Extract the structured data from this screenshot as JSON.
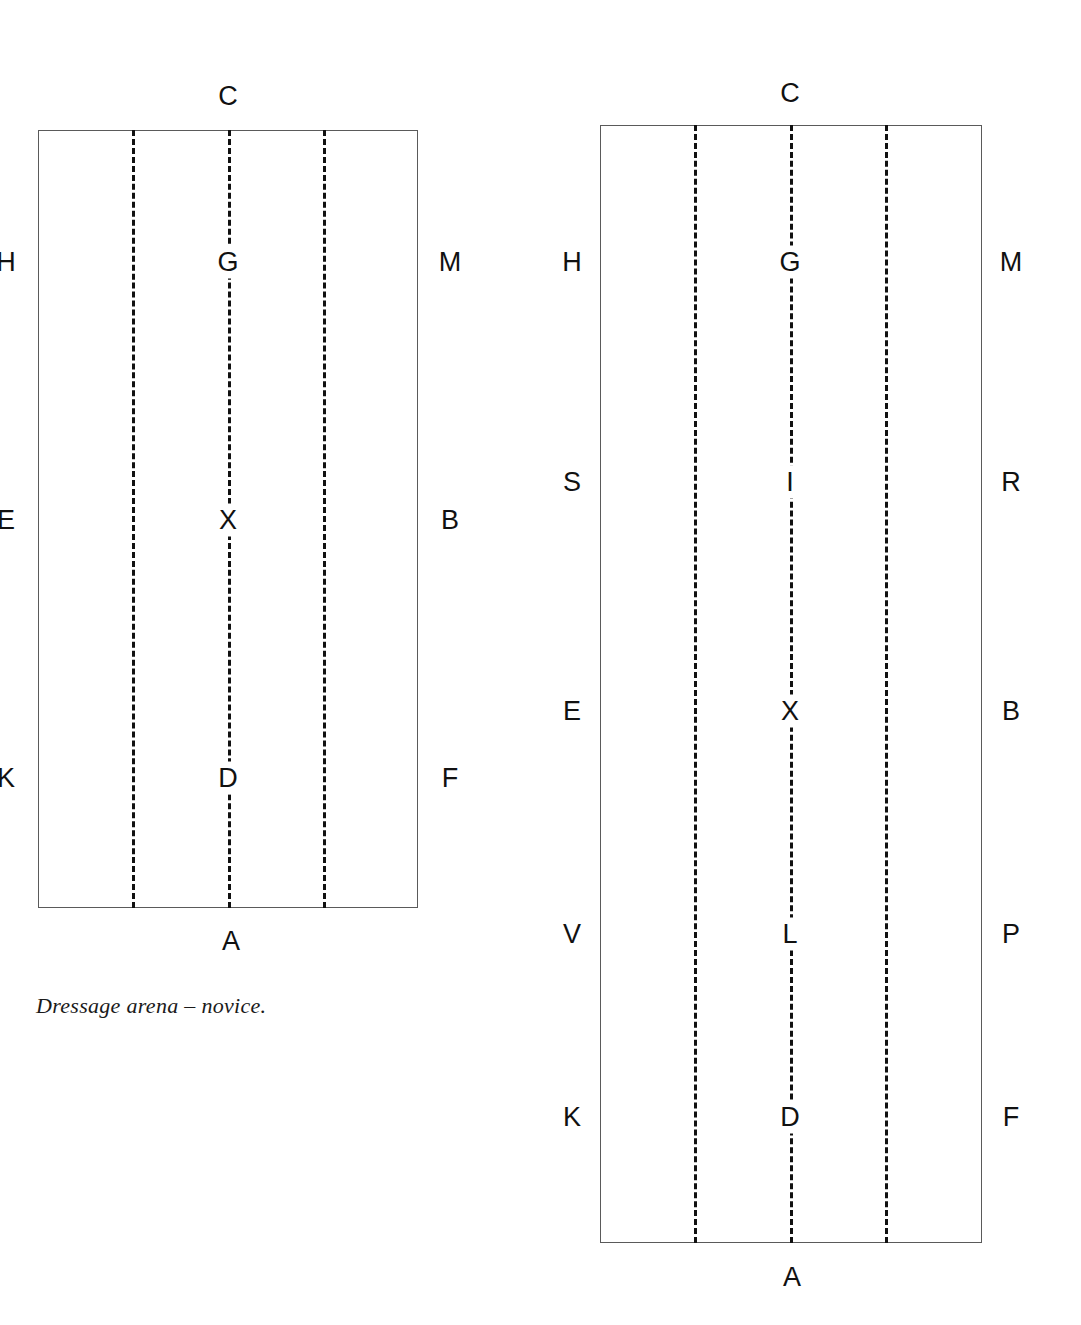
{
  "page": {
    "background_color": "#ffffff",
    "width": 1081,
    "height": 1325
  },
  "figures": [
    {
      "id": "novice-arena",
      "name": "Dressage arena - novice (20m x 40m)",
      "caption": "Dressage arena – novice.",
      "top_label": "C",
      "bottom_label": "A",
      "left_letters": [
        "H",
        "E",
        "K"
      ],
      "right_letters": [
        "M",
        "B",
        "F"
      ],
      "centre_letters": [
        "G",
        "X",
        "D"
      ]
    },
    {
      "id": "standard-arena",
      "name": "Dressage arena - standard (20m x 60m)",
      "caption": "",
      "top_label": "C",
      "bottom_label": "A",
      "left_letters": [
        "H",
        "S",
        "E",
        "V",
        "K"
      ],
      "right_letters": [
        "M",
        "R",
        "B",
        "P",
        "F"
      ],
      "centre_letters": [
        "G",
        "I",
        "X",
        "L",
        "D"
      ]
    }
  ],
  "left_arena": {
    "top_label": "C",
    "bottom_label": "A",
    "left_markers": [
      {
        "label": "H"
      },
      {
        "label": "E"
      },
      {
        "label": "K"
      }
    ],
    "right_markers": [
      {
        "label": "M"
      },
      {
        "label": "B"
      },
      {
        "label": "F"
      }
    ],
    "centre_markers": [
      {
        "label": "G"
      },
      {
        "label": "X"
      },
      {
        "label": "D"
      }
    ],
    "caption": "Dressage arena – novice."
  },
  "right_arena": {
    "top_label": "C",
    "bottom_label": "A",
    "left_markers": [
      {
        "label": "H"
      },
      {
        "label": "S"
      },
      {
        "label": "E"
      },
      {
        "label": "V"
      },
      {
        "label": "K"
      }
    ],
    "right_markers": [
      {
        "label": "M"
      },
      {
        "label": "R"
      },
      {
        "label": "B"
      },
      {
        "label": "P"
      },
      {
        "label": "F"
      }
    ],
    "centre_markers": [
      {
        "label": "G"
      },
      {
        "label": "I"
      },
      {
        "label": "X"
      },
      {
        "label": "L"
      },
      {
        "label": "D"
      }
    ]
  },
  "colors": {
    "background": "#ffffff",
    "outline": "#5a5a5a",
    "dash": "#111111",
    "text": "#111111",
    "caption_text": "#1a1a1a"
  }
}
